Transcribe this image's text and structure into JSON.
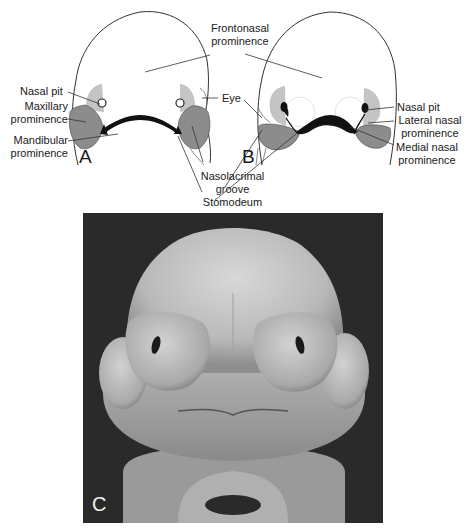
{
  "panels": {
    "a": {
      "letter": "A",
      "labels": {
        "nasal_pit": "Nasal pit",
        "maxillary_1": "Maxillary",
        "maxillary_2": "prominence",
        "mandibular_1": "Mandibular",
        "mandibular_2": "prominence"
      }
    },
    "b": {
      "letter": "B",
      "labels": {
        "nasal_pit": "Nasal pit",
        "lateral_1": "Lateral nasal",
        "lateral_2": "prominence",
        "medial_1": "Medial nasal",
        "medial_2": "prominence"
      }
    },
    "c": {
      "letter": "C",
      "description": "Scanning electron micrograph of embryonic face"
    }
  },
  "shared_labels": {
    "frontonasal_1": "Frontonasal",
    "frontonasal_2": "prominence",
    "eye": "Eye",
    "nasolacrimal_1": "Nasolacrimal",
    "nasolacrimal_2": "groove",
    "stomodeum": "Stomodeum"
  },
  "colors": {
    "outline": "#333333",
    "light_shade": "#c4c4c4",
    "dark_shade": "#8c8c8c",
    "stomodeum": "#111111",
    "photo_bg": "#2a2a2a"
  }
}
